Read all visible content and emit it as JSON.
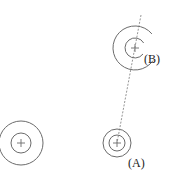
{
  "diagram": {
    "stroke_color": "#6b6b6b",
    "dash_color": "#7a7a7a",
    "label_color": "#222222",
    "circles": [
      {
        "id": "left",
        "cx": 21,
        "cy": 143,
        "r_outer": 22,
        "r_inner": 10,
        "label": ""
      },
      {
        "id": "A",
        "cx": 117,
        "cy": 143,
        "r_outer": 14,
        "r_inner": 8,
        "label": "(A)"
      },
      {
        "id": "B",
        "cx": 135,
        "cy": 48,
        "r_outer": 22,
        "r_inner": 10,
        "label": "(B)"
      }
    ],
    "dashed_line": {
      "x1": 141,
      "y1": 15,
      "x2": 117,
      "y2": 143
    },
    "labels": {
      "a": "(A)",
      "b": "(B)"
    }
  }
}
